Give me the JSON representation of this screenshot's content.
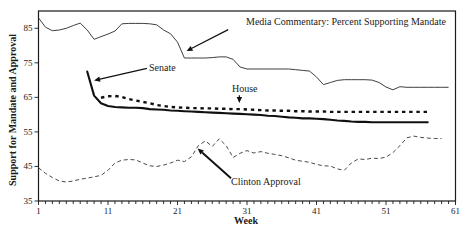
{
  "figure": {
    "background": "#ffffff",
    "frame_color": "#1a1a1a",
    "line_color": "#101010"
  },
  "chart_data": {
    "type": "line",
    "title": "",
    "xlabel": "Week",
    "ylabel": "Support for Mandate and Approval",
    "xlim": [
      1,
      61
    ],
    "ylim": [
      35,
      90
    ],
    "x_ticks": [
      1,
      11,
      21,
      31,
      41,
      51,
      61
    ],
    "x_minor_tick_interval": 1,
    "y_ticks": [
      85,
      75,
      65,
      55,
      45,
      35
    ],
    "grid": false,
    "legend_position": "inline-annotations",
    "series": [
      {
        "id": "media",
        "name": "Media Commentary: Percent Supporting Mandate",
        "style": "thin-solid",
        "start_week": 1,
        "values": [
          88,
          85.3,
          84.3,
          84.5,
          85,
          85.8,
          86.5,
          84.5,
          81.8,
          82.6,
          83.3,
          84.2,
          86.3,
          86.4,
          86.4,
          86.4,
          86.3,
          86,
          84.5,
          83.4,
          81,
          76.4,
          76.4,
          76.4,
          76.4,
          76.5,
          76.7,
          76.7,
          76,
          73.8,
          73.2,
          73.2,
          73.2,
          73.2,
          73.2,
          73.2,
          73.2,
          73,
          72.8,
          72.6,
          70.9,
          68.7,
          69.3,
          69.9,
          70.1,
          70.1,
          70.1,
          70.1,
          70,
          69.3,
          68,
          67.2,
          68.1,
          67.9,
          67.9,
          67.9,
          67.9,
          67.9,
          67.9,
          67.9
        ]
      },
      {
        "id": "senate",
        "name": "Senate",
        "style": "thick-solid",
        "start_week": 8,
        "values": [
          72.5,
          65.5,
          63.3,
          62.5,
          62.2,
          62.1,
          62,
          62,
          61.9,
          61.6,
          61.5,
          61.4,
          61.2,
          61.1,
          61,
          60.9,
          60.8,
          60.7,
          60.6,
          60.5,
          60.4,
          60.3,
          60.2,
          60.1,
          60,
          59.9,
          59.7,
          59.6,
          59.4,
          59.2,
          59.1,
          58.9,
          58.9,
          58.8,
          58.7,
          58.5,
          58.3,
          58.2,
          58,
          57.9,
          57.9,
          57.8,
          57.8,
          57.8,
          57.8,
          57.8,
          57.8,
          57.8,
          57.8,
          57.8
        ]
      },
      {
        "id": "house",
        "name": "House",
        "style": "bold-dashed",
        "start_week": 10,
        "values": [
          64.9,
          65.3,
          65.4,
          65.1,
          64.5,
          64.1,
          63.7,
          63.3,
          62.8,
          62.5,
          62.2,
          62.1,
          62,
          61.9,
          61.9,
          61.8,
          61.8,
          61.7,
          61.7,
          61.6,
          61.6,
          61.5,
          61.4,
          61.3,
          61.2,
          61.2,
          61.1,
          61.1,
          61,
          61,
          60.9,
          60.9,
          60.9,
          60.8,
          60.8,
          60.8,
          60.8,
          60.8,
          60.8,
          60.8,
          60.8,
          60.8,
          60.8,
          60.8,
          60.8,
          60.8,
          60.8,
          60.8
        ]
      },
      {
        "id": "clinton",
        "name": "Clinton Approval",
        "style": "thin-dashed",
        "start_week": 1,
        "values": [
          44.6,
          43,
          41.8,
          40.8,
          40.5,
          40.8,
          41.3,
          41.6,
          42,
          42.4,
          43.9,
          46,
          46.8,
          47,
          46.9,
          46,
          45.2,
          45,
          45.4,
          46,
          46.8,
          46.4,
          47.8,
          51,
          52.4,
          50.8,
          53,
          51,
          47.6,
          48.8,
          49.6,
          48.9,
          49.3,
          48.8,
          48.5,
          48.1,
          47.5,
          46.8,
          46.5,
          46.2,
          45.6,
          45.2,
          45.1,
          44.3,
          43.9,
          46,
          47.2,
          47,
          47.4,
          47.3,
          47.7,
          49,
          51,
          53.3,
          53.8,
          53.4,
          53.2,
          53.1,
          53.1
        ]
      }
    ],
    "annotations": [
      {
        "id": "media",
        "label": "Media Commentary: Percent Supporting Mandate",
        "arrow_weight": "thin",
        "arrow_from": {
          "week": 28.3,
          "value": 84.6
        },
        "arrow_to": {
          "week": 22.3,
          "value": 78.4
        }
      },
      {
        "id": "senate",
        "label": "Senate",
        "arrow_weight": "thin",
        "arrow_from": {
          "week": 16.6,
          "value": 73.4
        },
        "arrow_to": {
          "week": 9.0,
          "value": 69.9
        }
      },
      {
        "id": "house",
        "label": "House",
        "arrow_weight": "thin",
        "arrow_from": {
          "week": 29.9,
          "value": 65.6
        },
        "arrow_to": {
          "week": 29.9,
          "value": 63.4
        }
      },
      {
        "id": "clinton",
        "label": "Clinton Approval",
        "arrow_weight": "thick",
        "arrow_from": {
          "week": 28.7,
          "value": 41.6
        },
        "arrow_to": {
          "week": 23.9,
          "value": 50.2
        }
      }
    ]
  }
}
